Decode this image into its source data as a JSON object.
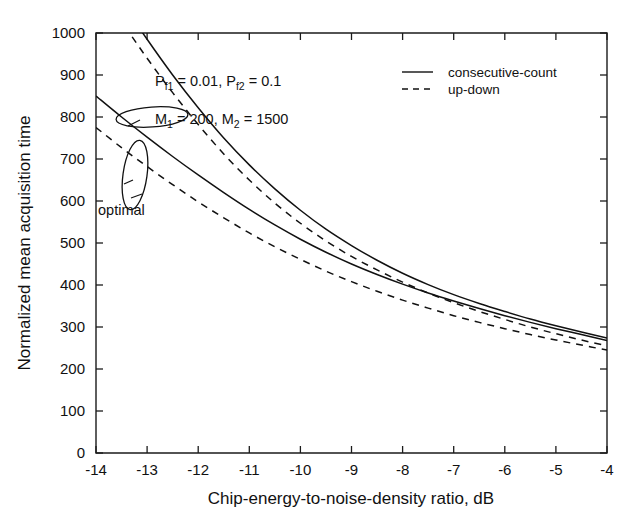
{
  "chart_data": {
    "type": "line",
    "title": "",
    "xlabel": "Chip-energy-to-noise-density ratio, dB",
    "ylabel": "Normalized mean acquisition time",
    "xlim": [
      -14,
      -4
    ],
    "ylim": [
      0,
      1000
    ],
    "xticks": [
      -14,
      -13,
      -12,
      -11,
      -10,
      -9,
      -8,
      -7,
      -6,
      -5,
      -4
    ],
    "xticklabels": [
      "-14",
      "-13",
      "-12",
      "-11",
      "-10",
      "-9",
      "-8",
      "-7",
      "-6",
      "-5",
      "-4"
    ],
    "yticks": [
      0,
      100,
      200,
      300,
      400,
      500,
      600,
      700,
      800,
      900,
      1000
    ],
    "yticklabels": [
      "0",
      "100",
      "200",
      "300",
      "400",
      "500",
      "600",
      "700",
      "800",
      "900",
      "1000"
    ],
    "grid": false,
    "legend_position": "top-right",
    "x": [
      -14,
      -13.5,
      -13,
      -12.5,
      -12,
      -11.5,
      -11,
      -10.5,
      -10,
      -9.5,
      -9,
      -8.5,
      -8,
      -7.5,
      -7,
      -6.5,
      -6,
      -5.5,
      -5,
      -4.5,
      -4
    ],
    "series": [
      {
        "name": "consecutive-count",
        "style": "solid",
        "label": "consecutive-count upper",
        "values": [
          1170,
          1075,
          985,
          900,
          822,
          750,
          686,
          629,
          578,
          533,
          494,
          459,
          428,
          401,
          377,
          356,
          337,
          319,
          303,
          288,
          274
        ]
      },
      {
        "name": "consecutive-count",
        "style": "solid",
        "label": "consecutive-count optimal",
        "values": [
          850,
          800,
          752,
          706,
          662,
          620,
          580,
          543,
          509,
          478,
          450,
          425,
          402,
          381,
          362,
          344,
          327,
          311,
          296,
          282,
          268
        ]
      },
      {
        "name": "up-down",
        "style": "dashed",
        "label": "up-down upper",
        "values": [
          1120,
          1028,
          940,
          858,
          782,
          712,
          650,
          595,
          547,
          505,
          468,
          436,
          407,
          381,
          358,
          337,
          318,
          300,
          284,
          269,
          255
        ]
      },
      {
        "name": "up-down",
        "style": "dashed",
        "label": "up-down optimal",
        "values": [
          775,
          727,
          682,
          639,
          598,
          560,
          524,
          491,
          461,
          433,
          408,
          385,
          364,
          345,
          327,
          311,
          296,
          282,
          269,
          257,
          245
        ]
      }
    ],
    "legend": [
      {
        "label": "consecutive-count",
        "style": "solid"
      },
      {
        "label": "up-down",
        "style": "dashed"
      }
    ],
    "annotations": [
      {
        "name": "false-alarm-params",
        "parts": [
          {
            "text": "P",
            "sub": ""
          },
          {
            "text": "f1",
            "sub": "true"
          },
          {
            "text": " = 0.01, P",
            "sub": ""
          },
          {
            "text": "f2",
            "sub": "true"
          },
          {
            "text": " = 0.1",
            "sub": ""
          }
        ],
        "plain": "Pf1 = 0.01, Pf2 = 0.1"
      },
      {
        "name": "dwell-params",
        "parts": [
          {
            "text": "M",
            "sub": ""
          },
          {
            "text": "1",
            "sub": "true"
          },
          {
            "text": " = 200, M",
            "sub": ""
          },
          {
            "text": "2",
            "sub": "true"
          },
          {
            "text": " = 1500",
            "sub": ""
          }
        ],
        "plain": "M1 = 200, M2 = 1500"
      },
      {
        "name": "optimal-label",
        "plain": "optimal"
      }
    ],
    "annotation_text": {
      "pf_prefix1": "P",
      "pf_sub1": "f1",
      "pf_mid": " = 0.01, P",
      "pf_sub2": "f2",
      "pf_end": " = 0.1",
      "m_prefix1": "M",
      "m_sub1": "1",
      "m_mid": " = 200, M",
      "m_sub2": "2",
      "m_end": " = 1500",
      "optimal": "optimal"
    }
  },
  "colors": {
    "background": "#ffffff",
    "axis": "#1b1b1b",
    "curve": "#111111",
    "text": "#111111"
  }
}
